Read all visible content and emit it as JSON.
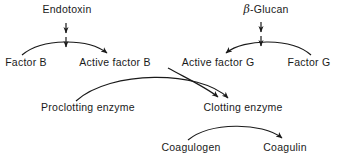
{
  "diagram": {
    "background_color": "#ffffff",
    "stroke_color": "#1a1a1a",
    "text_color": "#1a1a1a",
    "nodes": [
      {
        "id": "endotoxin",
        "label": "Endotoxin",
        "x": 67,
        "y": 9
      },
      {
        "id": "beta-glucan-prefix",
        "label": "-Glucan",
        "x": 266,
        "y": 9
      },
      {
        "id": "factor-b",
        "label": "Factor B",
        "x": 26,
        "y": 62
      },
      {
        "id": "active-factor-b",
        "label": "Active factor B",
        "x": 115,
        "y": 62
      },
      {
        "id": "active-factor-g",
        "label": "Active factor G",
        "x": 218,
        "y": 62
      },
      {
        "id": "factor-g",
        "label": "Factor G",
        "x": 309,
        "y": 62
      },
      {
        "id": "proclotting-enzyme",
        "label": "Proclotting enzyme",
        "x": 88,
        "y": 107
      },
      {
        "id": "clotting-enzyme",
        "label": "Clotting enzyme",
        "x": 243,
        "y": 107
      },
      {
        "id": "coagulogen",
        "label": "Coagulogen",
        "x": 191,
        "y": 147
      },
      {
        "id": "coagulin",
        "label": "Coagulin",
        "x": 285,
        "y": 147
      }
    ],
    "beta_symbol": "β",
    "edges": [
      {
        "id": "edge-factor-b-to-active-factor-b",
        "from": "factor-b",
        "to": "active-factor-b",
        "style": "arc"
      },
      {
        "id": "edge-factor-g-to-active-factor-g",
        "from": "factor-g",
        "to": "active-factor-g",
        "style": "arc"
      },
      {
        "id": "edge-endotoxin-to-activation",
        "from": "endotoxin",
        "to": "factor-b-activation",
        "style": "double-down-arrow"
      },
      {
        "id": "edge-beta-glucan-to-activation",
        "from": "beta-glucan",
        "to": "factor-g-activation",
        "style": "double-down-arrow"
      },
      {
        "id": "edge-proclotting-to-clotting-enzyme",
        "from": "proclotting-enzyme",
        "to": "clotting-enzyme",
        "style": "arc"
      },
      {
        "id": "edge-active-factor-g-to-clotting-enzyme",
        "from": "active-factor-g",
        "to": "clotting-enzyme",
        "style": "arc"
      },
      {
        "id": "edge-coagulogen-to-coagulin",
        "from": "coagulogen",
        "to": "coagulin",
        "style": "arc"
      }
    ]
  }
}
